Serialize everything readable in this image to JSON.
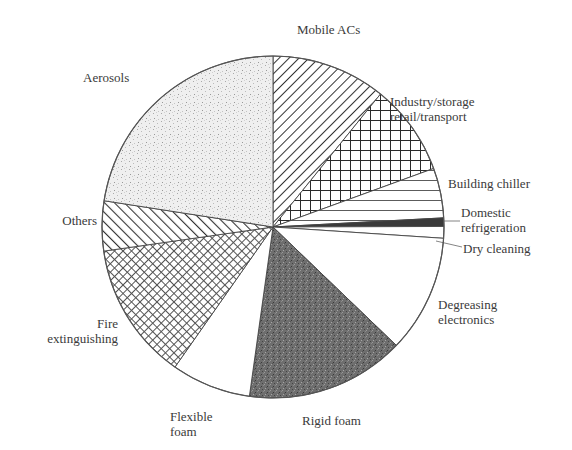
{
  "chart_data": {
    "type": "pie",
    "title": "",
    "center": [
      273,
      227
    ],
    "radius": 171,
    "start_angle_deg": 0,
    "direction": "clockwise",
    "unit": "percent (estimated from slice angles)",
    "slices": [
      {
        "name": "Mobile ACs",
        "value": 10.8,
        "pattern": "diag-hatch-back",
        "fill": "#ffffff",
        "ink": "#333333"
      },
      {
        "name": "Industry/storage retail/transport",
        "value": 8.6,
        "pattern": "grid-coarse",
        "fill": "#ffffff",
        "ink": "#2a2a2a"
      },
      {
        "name": "Building chiller",
        "value": 4.7,
        "pattern": "horizontal-lines",
        "fill": "#ffffff",
        "ink": "#333333"
      },
      {
        "name": "Domestic refrigeration",
        "value": 0.8,
        "pattern": "solid-dark",
        "fill": "#3a3a3a",
        "ink": "#3a3a3a"
      },
      {
        "name": "Dry cleaning",
        "value": 1.1,
        "pattern": "none",
        "fill": "#ffffff",
        "ink": "#555555"
      },
      {
        "name": "Degreasing electronics",
        "value": 11.1,
        "pattern": "none",
        "fill": "#ffffff",
        "ink": "#555555"
      },
      {
        "name": "Rigid foam",
        "value": 15.0,
        "pattern": "dense-speckle",
        "fill": "#6b6b6b",
        "ink": "#4a4a4a"
      },
      {
        "name": "Flexible foam",
        "value": 7.5,
        "pattern": "none",
        "fill": "#ffffff",
        "ink": "#555555"
      },
      {
        "name": "Fire extinguishing",
        "value": 13.0,
        "pattern": "crosshatch-fine",
        "fill": "#ffffff",
        "ink": "#555555"
      },
      {
        "name": "Others",
        "value": 4.7,
        "pattern": "diag-hatch-fwd",
        "fill": "#ffffff",
        "ink": "#333333"
      },
      {
        "name": "Aerosols",
        "value": 22.5,
        "pattern": "light-stipple",
        "fill": "#ececec",
        "ink": "#9a9a9a"
      }
    ],
    "labels": [
      {
        "lines": [
          "Mobile ACs"
        ],
        "x": 297,
        "y": 22,
        "align": "left"
      },
      {
        "lines": [
          "Industry/storage",
          "retail/transport"
        ],
        "x": 390,
        "y": 94,
        "align": "left"
      },
      {
        "lines": [
          "Building chiller"
        ],
        "x": 448,
        "y": 176,
        "align": "left"
      },
      {
        "lines": [
          "Domestic",
          "refrigeration"
        ],
        "x": 461,
        "y": 205,
        "align": "left"
      },
      {
        "lines": [
          "Dry cleaning"
        ],
        "x": 463,
        "y": 241,
        "align": "left"
      },
      {
        "lines": [
          "Degreasing",
          "electronics"
        ],
        "x": 438,
        "y": 297,
        "align": "left"
      },
      {
        "lines": [
          "Rigid foam"
        ],
        "x": 302,
        "y": 413,
        "align": "left"
      },
      {
        "lines": [
          "Flexible",
          "foam"
        ],
        "x": 170,
        "y": 409,
        "align": "left"
      },
      {
        "lines": [
          "Fire",
          "extinguishing"
        ],
        "x": 118,
        "y": 316,
        "align": "right"
      },
      {
        "lines": [
          "Others"
        ],
        "x": 97,
        "y": 213,
        "align": "right"
      },
      {
        "lines": [
          "Aerosols"
        ],
        "x": 83,
        "y": 70,
        "align": "left"
      }
    ],
    "leader_lines": [
      {
        "label": "Domestic refrigeration",
        "from": [
          443,
          221
        ],
        "to": [
          460,
          221
        ]
      },
      {
        "label": "Dry cleaning",
        "from": [
          436,
          241
        ],
        "to": [
          462,
          247
        ]
      }
    ],
    "legend": null,
    "grid": false
  }
}
